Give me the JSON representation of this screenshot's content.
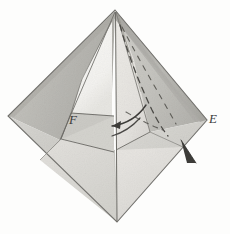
{
  "figure": {
    "domain": "Diagram",
    "kind": "origami-folding-diagram",
    "background_color": "#fdfdfc",
    "ink_color": "#4a4a4a",
    "labels": [
      {
        "id": "E",
        "text": "E",
        "role": "right-vertex-label",
        "x": 209,
        "y": 112
      },
      {
        "id": "F",
        "text": "F",
        "role": "left-inner-flap-label",
        "x": 69,
        "y": 113
      }
    ],
    "vertices": {
      "top": [
        115,
        10
      ],
      "left": [
        8,
        116
      ],
      "right": [
        207,
        120
      ],
      "bottom": [
        117,
        222
      ]
    },
    "palette": {
      "paper_light": "#f0efec",
      "paper_white": "#fbfbf9",
      "paper_mid": "#d2d1cd",
      "paper_mid_dark": "#c2c1bc",
      "paper_dark": "#b2b1ac",
      "paper_shadow": "#a6a5a0",
      "edge_line": "#6e6d68",
      "dash_line": "#4c4b47",
      "arrow_fill": "#3e3d3a"
    },
    "annotations": [
      {
        "name": "dashed-fold-curve-left",
        "type": "dashed-curve",
        "note": "curve descending from apex toward centre"
      },
      {
        "name": "dashed-fold-curve-right",
        "type": "dashed-curve",
        "note": "curve descending toward right vertex"
      },
      {
        "name": "motion-arrow-curved",
        "type": "curved-arrow",
        "direction": "leftward",
        "note": "indicates flap swinging to the left"
      },
      {
        "name": "pointer-arrowhead",
        "type": "solid-arrowhead",
        "direction": "down-left",
        "note": "solid triangular pointer near right lower edge"
      }
    ]
  }
}
